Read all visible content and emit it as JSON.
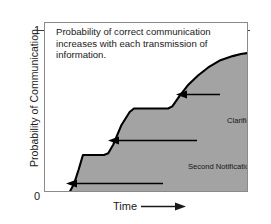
{
  "chart_data": {
    "type": "line",
    "title": "",
    "subtitle": "",
    "xlabel": "Time",
    "ylabel": "Probability of Communication",
    "xlim": [
      0,
      100
    ],
    "ylim": [
      0,
      1
    ],
    "x_tick_labels": [],
    "y_tick_labels": [
      "0",
      "1"
    ],
    "y_ticks": [
      0,
      1
    ],
    "grid": false,
    "legend": "none",
    "fill": true,
    "fill_color": "#a3a3a3",
    "line_color": "#000000",
    "note": "Probability of correct communication\nincreases with each transmission of\ninformation.",
    "series": [
      {
        "name": "Probability of Communication",
        "x": [
          0,
          11.8,
          14.2,
          16.5,
          18.6,
          28.9,
          31.0,
          33.5,
          37.5,
          41.5,
          43.6,
          60.3,
          62.4,
          66.0,
          70.0,
          75.0,
          80.0,
          86.0,
          92.0,
          96.0,
          100.0
        ],
        "values": [
          0.0,
          0.0,
          0.055,
          0.145,
          0.235,
          0.235,
          0.245,
          0.3,
          0.42,
          0.5,
          0.522,
          0.522,
          0.535,
          0.6,
          0.665,
          0.725,
          0.775,
          0.82,
          0.845,
          0.858,
          0.865
        ]
      }
    ],
    "annotations": [
      {
        "name": "first-notification",
        "label": "First Notification to Response Force",
        "arrow": "left",
        "points_to_x": 13.0,
        "points_to_y": 0.04
      },
      {
        "name": "second-notification",
        "label": "Second Notification",
        "arrow": "left",
        "points_to_x": 30.5,
        "points_to_y": 0.33
      },
      {
        "name": "clarification",
        "label": "Clarification",
        "arrow": "left",
        "points_to_x": 62.5,
        "points_to_y": 0.585
      }
    ]
  },
  "axes": {
    "y_title": "Probability of Communication",
    "y_tick_top": "1",
    "y_tick_bottom": "0",
    "x_title": "Time",
    "x_arrow_icon": "right-arrow-icon"
  },
  "note": {
    "text": "Probability of correct communication\nincreases with each transmission of\ninformation."
  },
  "annotations": {
    "clarification": "Clarification",
    "second_notification": "Second Notification",
    "first_notification": "First Notification to Response Force"
  },
  "colors": {
    "fill": "#a3a3a3",
    "line": "#000000",
    "frame": "#8a8a8a",
    "text": "#1a1a1a",
    "background": "#ffffff"
  }
}
